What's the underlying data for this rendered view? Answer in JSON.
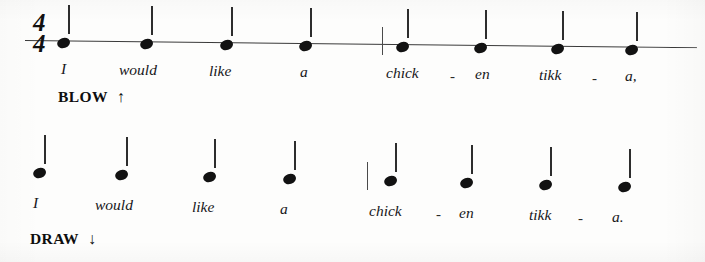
{
  "document": {
    "type": "harmonica-rhythm-tablature",
    "background_color": "#fdfdfc",
    "ink_color": "#121212"
  },
  "systems": [
    {
      "id": "system-1",
      "time_signature": {
        "numerator": "4",
        "denominator": "4"
      },
      "direction_label": "BLOW",
      "direction_arrow": "↑",
      "direction_meaning": "blow",
      "note_count": 8,
      "note_value": "quarter",
      "stem_direction": "up",
      "barline_after_note": 4,
      "notes": [
        {
          "index": 1,
          "x": 57,
          "y": 38,
          "stem": "up"
        },
        {
          "index": 2,
          "x": 140,
          "y": 39,
          "stem": "up"
        },
        {
          "index": 3,
          "x": 220,
          "y": 40,
          "stem": "up"
        },
        {
          "index": 4,
          "x": 299,
          "y": 41,
          "stem": "up"
        },
        {
          "index": 5,
          "x": 396,
          "y": 42,
          "stem": "up"
        },
        {
          "index": 6,
          "x": 474,
          "y": 43,
          "stem": "up"
        },
        {
          "index": 7,
          "x": 551,
          "y": 44,
          "stem": "up"
        },
        {
          "index": 8,
          "x": 625,
          "y": 45,
          "stem": "up"
        }
      ],
      "barline": {
        "x": 382,
        "y": 27,
        "height": 28
      },
      "lyrics": [
        {
          "text": "I",
          "x": 61,
          "y": 60
        },
        {
          "text": "would",
          "x": 119,
          "y": 61
        },
        {
          "text": "like",
          "x": 209,
          "y": 62
        },
        {
          "text": "a",
          "x": 300,
          "y": 63
        },
        {
          "text": "chick",
          "x": 386,
          "y": 64
        },
        {
          "text": "en",
          "x": 475,
          "y": 65
        },
        {
          "text": "tikk",
          "x": 539,
          "y": 66
        },
        {
          "text": "a,",
          "x": 625,
          "y": 67
        }
      ],
      "hyphens": [
        {
          "text": "-",
          "x": 450,
          "y": 68
        },
        {
          "text": "-",
          "x": 592,
          "y": 70
        }
      ],
      "lyric_line_text": "I would like a chick - en tikk - a,"
    },
    {
      "id": "system-2",
      "time_signature": null,
      "direction_label": "DRAW",
      "direction_arrow": "↓",
      "direction_meaning": "draw",
      "note_count": 8,
      "note_value": "quarter",
      "stem_direction": "up",
      "barline_after_note": 4,
      "notes": [
        {
          "index": 1,
          "x": 33,
          "y": 38,
          "stem": "up"
        },
        {
          "index": 2,
          "x": 115,
          "y": 40,
          "stem": "up"
        },
        {
          "index": 3,
          "x": 203,
          "y": 42,
          "stem": "up"
        },
        {
          "index": 4,
          "x": 283,
          "y": 44,
          "stem": "up"
        },
        {
          "index": 5,
          "x": 384,
          "y": 46,
          "stem": "up"
        },
        {
          "index": 6,
          "x": 460,
          "y": 48,
          "stem": "up"
        },
        {
          "index": 7,
          "x": 539,
          "y": 50,
          "stem": "up"
        },
        {
          "index": 8,
          "x": 618,
          "y": 52,
          "stem": "up"
        }
      ],
      "barline": {
        "x": 367,
        "y": 32,
        "height": 28
      },
      "lyrics": [
        {
          "text": "I",
          "x": 33,
          "y": 64
        },
        {
          "text": "would",
          "x": 95,
          "y": 66
        },
        {
          "text": "like",
          "x": 192,
          "y": 68
        },
        {
          "text": "a",
          "x": 280,
          "y": 70
        },
        {
          "text": "chick",
          "x": 369,
          "y": 72
        },
        {
          "text": "en",
          "x": 459,
          "y": 74
        },
        {
          "text": "tikk",
          "x": 529,
          "y": 76
        },
        {
          "text": "a.",
          "x": 612,
          "y": 78
        }
      ],
      "hyphens": [
        {
          "text": "-",
          "x": 436,
          "y": 76
        },
        {
          "text": "-",
          "x": 578,
          "y": 80
        }
      ],
      "lyric_line_text": "I would like a chick - en tikk - a."
    }
  ]
}
